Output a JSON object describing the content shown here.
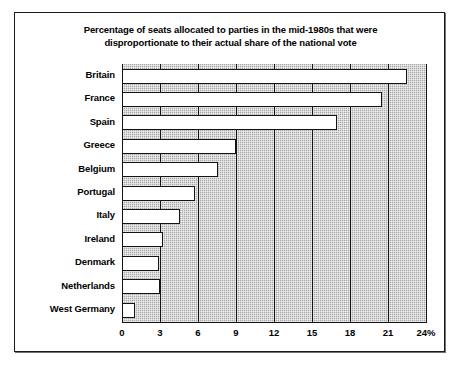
{
  "chart_data": {
    "type": "bar",
    "orientation": "horizontal",
    "title": "Percentage of seats allocated to parties in the mid-1980s that were disproportionate to their actual share of the national vote",
    "title_lines": [
      "Percentage of seats allocated to parties in the mid-1980s that were",
      "disproportionate to their actual share of the national vote"
    ],
    "xlabel": "",
    "ylabel": "",
    "categories": [
      "Britain",
      "France",
      "Spain",
      "Greece",
      "Belgium",
      "Portugal",
      "Italy",
      "Ireland",
      "Denmark",
      "Netherlands",
      "West Germany"
    ],
    "values": [
      22.5,
      20.5,
      17.0,
      9.0,
      7.6,
      5.8,
      4.6,
      3.2,
      2.9,
      3.0,
      1.0
    ],
    "xlim": [
      0,
      24
    ],
    "xticks": [
      0,
      3,
      6,
      9,
      12,
      15,
      18,
      21,
      24
    ],
    "xtick_labels": [
      "0",
      "3",
      "6",
      "9",
      "12",
      "15",
      "18",
      "21",
      "24%"
    ],
    "grid": true,
    "legend": false,
    "bar_fill_color": "#ffffff",
    "bar_edge_color": "#141414",
    "plot_background_color": "#a9a9a9",
    "figure_background_color": "#ffffff",
    "frame_color": "#1a1a1a"
  }
}
